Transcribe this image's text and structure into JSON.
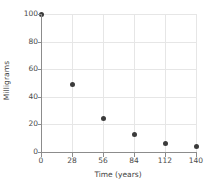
{
  "chart_data": {
    "type": "scatter",
    "title": "",
    "xlabel": "Time (years)",
    "ylabel": "Milligrams",
    "x": [
      0,
      28,
      56,
      84,
      112,
      140
    ],
    "values": [
      100,
      49,
      24,
      13,
      6,
      4
    ],
    "points": [
      {
        "x": 0,
        "y": 100
      },
      {
        "x": 28,
        "y": 49
      },
      {
        "x": 56,
        "y": 24
      },
      {
        "x": 84,
        "y": 13
      },
      {
        "x": 112,
        "y": 6
      },
      {
        "x": 140,
        "y": 4
      }
    ],
    "xlim": [
      0,
      140
    ],
    "ylim": [
      0,
      100
    ],
    "xticks": [
      0,
      28,
      56,
      84,
      112,
      140
    ],
    "yticks": [
      0,
      20,
      40,
      60,
      80,
      100
    ],
    "xtick_labels": [
      "0",
      "28",
      "56",
      "84",
      "112",
      "140"
    ],
    "ytick_labels": [
      "0",
      "20",
      "40",
      "60",
      "80",
      "100"
    ],
    "grid": true,
    "legend": false,
    "marker_color": "#3b3b3b",
    "grid_color": "#e6e6e6",
    "axis_color": "#8c8c8c",
    "background": "#ffffff"
  }
}
